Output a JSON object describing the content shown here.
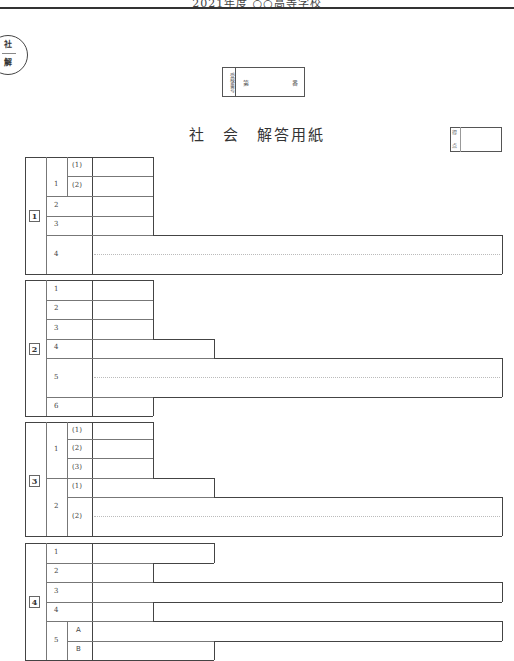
{
  "header": {
    "text": "2021年度 ○○高等学校",
    "badge_top": "社",
    "badge_bottom": "解"
  },
  "exam_number": {
    "label": "受検番号",
    "prefix": "第",
    "suffix": "番"
  },
  "title": "社　会　解答用紙",
  "score": {
    "label_top": "得",
    "label_bottom": "点"
  },
  "sections": [
    {
      "number": "1",
      "rows": [
        {
          "q": "1",
          "sub": "(1)"
        },
        {
          "q": "1",
          "sub": "(2)"
        },
        {
          "q": "2"
        },
        {
          "q": "3"
        },
        {
          "q": "4"
        }
      ]
    },
    {
      "number": "2",
      "rows": [
        {
          "q": "1"
        },
        {
          "q": "2"
        },
        {
          "q": "3"
        },
        {
          "q": "4"
        },
        {
          "q": "5"
        },
        {
          "q": "6"
        }
      ]
    },
    {
      "number": "3",
      "rows": [
        {
          "q": "1",
          "sub": "(1)"
        },
        {
          "q": "1",
          "sub": "(2)"
        },
        {
          "q": "1",
          "sub": "(3)"
        },
        {
          "q": "2",
          "sub": "(1)"
        },
        {
          "q": "2",
          "sub": "(2)"
        }
      ]
    },
    {
      "number": "4",
      "rows": [
        {
          "q": "1"
        },
        {
          "q": "2"
        },
        {
          "q": "3"
        },
        {
          "q": "4"
        },
        {
          "q": "5",
          "sub": "A"
        },
        {
          "q": "5",
          "sub": "B"
        }
      ]
    }
  ]
}
